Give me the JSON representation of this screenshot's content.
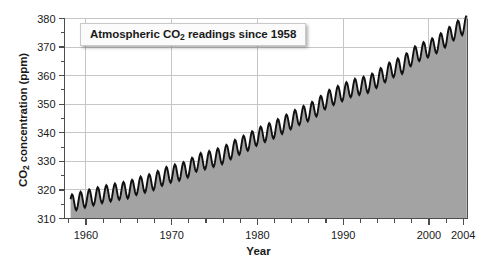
{
  "chart_data": {
    "type": "area",
    "title": "Atmospheric CO2 readings since 1958",
    "title_prefix": "Atmospheric CO",
    "title_sub": "2",
    "title_suffix": " readings since 1958",
    "xlabel": "Year",
    "ylabel": "CO2 concentration (ppm)",
    "ylabel_prefix": "CO",
    "ylabel_sub": "2",
    "ylabel_suffix": " concentration (ppm)",
    "xlim": [
      1957.5,
      2004.5
    ],
    "ylim": [
      310,
      380
    ],
    "x_major_ticks": [
      1960,
      1970,
      1980,
      1990,
      2000,
      2004
    ],
    "x_major_labels": [
      "1960",
      "1970",
      "1980",
      "1990",
      "2000",
      "2004"
    ],
    "x_minor_tick_step": 2,
    "y_major_ticks": [
      310,
      320,
      330,
      340,
      350,
      360,
      370,
      380
    ],
    "y_major_labels": [
      "310",
      "320",
      "330",
      "340",
      "350",
      "360",
      "370",
      "380"
    ],
    "y_minor_tick_step": 5,
    "grid": true,
    "grid_x_at": [
      1960,
      1970,
      1980,
      1990,
      2000
    ],
    "grid_y_at": [
      320,
      330,
      340,
      350,
      360,
      370,
      380
    ],
    "legend": "none",
    "series_name": "Mauna Loa monthly mean CO2",
    "seasonal_amplitude_ppm": 3.0,
    "line_color": "#111111",
    "fill_color": "#a3a3a3",
    "grid_color": "#c6c6c6",
    "axis_color": "#4d4d4d",
    "background_color": "#ffffff",
    "x": [
      1958.2,
      1959.0,
      1960.0,
      1961.0,
      1962.0,
      1963.0,
      1964.0,
      1965.0,
      1966.0,
      1967.0,
      1968.0,
      1969.0,
      1970.0,
      1971.0,
      1972.0,
      1973.0,
      1974.0,
      1975.0,
      1976.0,
      1977.0,
      1978.0,
      1979.0,
      1980.0,
      1981.0,
      1982.0,
      1983.0,
      1984.0,
      1985.0,
      1986.0,
      1987.0,
      1988.0,
      1989.0,
      1990.0,
      1991.0,
      1992.0,
      1993.0,
      1994.0,
      1995.0,
      1996.0,
      1997.0,
      1998.0,
      1999.0,
      2000.0,
      2001.0,
      2002.0,
      2003.0,
      2004.0
    ],
    "annual_mean_values": [
      315.3,
      315.98,
      316.91,
      317.64,
      318.45,
      318.99,
      319.62,
      320.04,
      321.38,
      322.16,
      323.04,
      324.62,
      325.68,
      326.32,
      327.45,
      329.68,
      330.25,
      331.15,
      332.15,
      333.9,
      335.5,
      336.85,
      338.69,
      339.93,
      341.13,
      342.78,
      344.42,
      345.9,
      347.15,
      348.93,
      351.48,
      352.91,
      354.19,
      355.59,
      356.37,
      357.04,
      358.89,
      360.88,
      362.64,
      363.76,
      366.63,
      368.31,
      369.48,
      371.02,
      373.1,
      375.64,
      377.38
    ]
  }
}
